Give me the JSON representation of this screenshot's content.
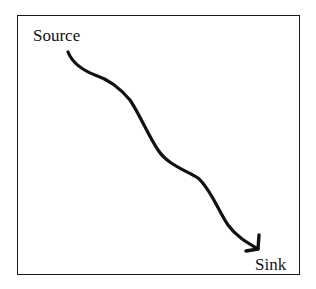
{
  "diagram": {
    "nodes": [
      {
        "id": "source",
        "label": "Source"
      },
      {
        "id": "sink",
        "label": "Sink"
      }
    ],
    "edges": [
      {
        "from": "source",
        "to": "sink",
        "style": "wavy-arrow"
      }
    ],
    "colors": {
      "stroke": "#111111",
      "background": "#ffffff"
    }
  }
}
